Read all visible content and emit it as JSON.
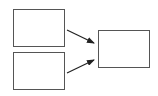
{
  "diagram": {
    "boxes": [
      {
        "id": "input-top",
        "x": 13,
        "y": 9,
        "w": 52,
        "h": 38
      },
      {
        "id": "input-bottom",
        "x": 13,
        "y": 52,
        "w": 52,
        "h": 38
      },
      {
        "id": "output",
        "x": 98,
        "y": 30,
        "w": 52,
        "h": 38
      }
    ],
    "arrows": [
      {
        "from": "input-top",
        "to": "output"
      },
      {
        "from": "input-bottom",
        "to": "output"
      }
    ],
    "colors": {
      "stroke": "#555555",
      "arrow": "#222222",
      "fill": "#ffffff"
    }
  }
}
